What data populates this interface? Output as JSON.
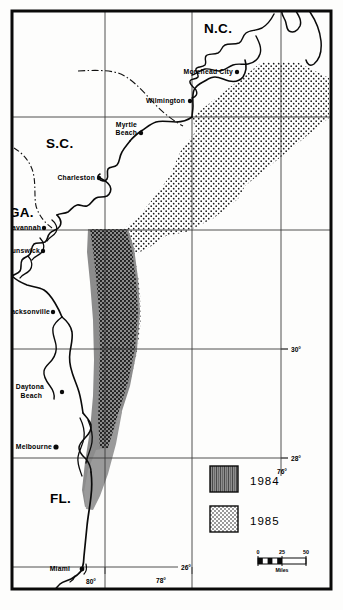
{
  "figure": {
    "name": "coastal-distribution-map",
    "region_description": "U.S. southeast Atlantic coast"
  },
  "states": [
    {
      "label": "N.C.",
      "x": 204,
      "y": 27
    },
    {
      "label": "S.C.",
      "x": 46,
      "y": 142
    },
    {
      "label": "GA.",
      "x": 9,
      "y": 211
    },
    {
      "label": "FL.",
      "x": 50,
      "y": 497
    }
  ],
  "cities": [
    {
      "label": "Morehead City",
      "anchor": "end",
      "tx": 233,
      "ty": 71,
      "dx": 237,
      "dy": 72
    },
    {
      "label": "Wilmington",
      "anchor": "end",
      "tx": 185,
      "ty": 99,
      "dx": 190,
      "dy": 101
    },
    {
      "label": "Myrtle",
      "anchor": "end",
      "tx": 139,
      "ty": 123,
      "dx": null,
      "dy": null
    },
    {
      "label": "Beach",
      "anchor": "end",
      "tx": 137,
      "ty": 131,
      "dx": 141,
      "dy": 133
    },
    {
      "label": "Charleston",
      "anchor": "end",
      "tx": 95,
      "ty": 176,
      "dx": 99,
      "dy": 178
    },
    {
      "label": "Savannah",
      "anchor": "end",
      "tx": 41,
      "ty": 227,
      "dx": 44,
      "dy": 228
    },
    {
      "label": "Brunswick",
      "anchor": "end",
      "tx": 40,
      "ty": 250,
      "dx": 43,
      "dy": 251
    },
    {
      "label": "Jacksonville",
      "anchor": "end",
      "tx": 50,
      "ty": 311,
      "dx": 53,
      "dy": 312
    },
    {
      "label": "Daytona",
      "anchor": "end",
      "tx": 44,
      "ty": 387,
      "dx": null,
      "dy": null
    },
    {
      "label": "Beach",
      "anchor": "end",
      "tx": 42,
      "ty": 396,
      "dx": null,
      "dy": null
    },
    {
      "label": "Melbourne",
      "anchor": "end",
      "tx": 52,
      "ty": 446,
      "dx": 56,
      "dy": 447
    },
    {
      "label": "Miami",
      "anchor": "end",
      "tx": 70,
      "ty": 568,
      "dx": 73,
      "dy": 569
    }
  ],
  "graticule": {
    "latitude_labels": [
      {
        "label": "30°",
        "x": 294,
        "y": 349
      },
      {
        "label": "28°",
        "x": 294,
        "y": 458
      },
      {
        "label": "26°",
        "x": 183,
        "y": 567
      }
    ],
    "longitude_labels": [
      {
        "label": "76°",
        "x": 281,
        "y": 471
      },
      {
        "label": "78°",
        "x": 161,
        "y": 580
      },
      {
        "label": "80°",
        "x": 91,
        "y": 581
      }
    ]
  },
  "legend": {
    "name": "map-legend",
    "entries": [
      {
        "label": "1984",
        "pattern": "dark-dense-fill",
        "color": "#8c8c8c"
      },
      {
        "label": "1985",
        "pattern": "light-stipple-fill",
        "color": "#ffffff"
      }
    ]
  },
  "scale_bar": {
    "ticks": [
      "0",
      "25",
      "50"
    ],
    "unit": "Miles"
  },
  "colors": {
    "ink": "#000000",
    "fill_1984": "#8c8c8c",
    "fill_1985": "#ffffff",
    "grid": "#3a3a3a",
    "paper": "#fdfdfc"
  }
}
